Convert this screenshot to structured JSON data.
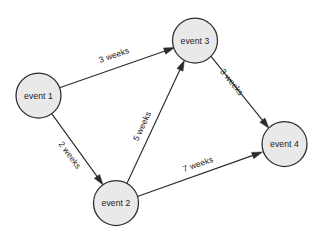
{
  "diagram": {
    "type": "directed-graph",
    "canvas": {
      "width": 324,
      "height": 243,
      "background": "#ffffff"
    },
    "style": {
      "node_fill": "#e9e9e9",
      "node_stroke": "#2b2b2b",
      "edge_stroke": "#2b2b2b",
      "text_color": "#1a1a1a"
    },
    "nodes": [
      {
        "id": "event1",
        "label": "event 1",
        "cx": 38.5,
        "cy": 95.5,
        "r": 22.5
      },
      {
        "id": "event2",
        "label": "event 2",
        "cx": 116.0,
        "cy": 203.0,
        "r": 22.5
      },
      {
        "id": "event3",
        "label": "event 3",
        "cx": 195.0,
        "cy": 40.5,
        "r": 22.5
      },
      {
        "id": "event4",
        "label": "event 4",
        "cx": 284.5,
        "cy": 144.0,
        "r": 22.5
      }
    ],
    "edges": [
      {
        "id": "e1-e3",
        "from": "event1",
        "to": "event3",
        "label": "3 weeks",
        "x1": 59.6,
        "y1": 87.7,
        "x2": 174.5,
        "y2": 47.6,
        "label_x": 114,
        "label_y": 55,
        "label_rotate": -19
      },
      {
        "id": "e1-e2",
        "from": "event1",
        "to": "event2",
        "label": "2 weeks",
        "x1": 51.7,
        "y1": 113.7,
        "x2": 103.1,
        "y2": 184.9,
        "label_x": 70,
        "label_y": 155,
        "label_rotate": 54
      },
      {
        "id": "e2-e3",
        "from": "event2",
        "to": "event3",
        "label": "5 weeks",
        "x1": 127.0,
        "y1": 183.3,
        "x2": 184.4,
        "y2": 60.3,
        "label_x": 142,
        "label_y": 126,
        "label_rotate": -65
      },
      {
        "id": "e3-e4",
        "from": "event3",
        "to": "event4",
        "label": "3 weeks",
        "x1": 211.0,
        "y1": 56.3,
        "x2": 269.0,
        "y2": 128.3,
        "label_x": 232,
        "label_y": 82,
        "label_rotate": 51
      },
      {
        "id": "e2-e4",
        "from": "event2",
        "to": "event4",
        "label": "7 weeks",
        "x1": 138.1,
        "y1": 196.3,
        "x2": 262.5,
        "y2": 152.0,
        "label_x": 198,
        "label_y": 164,
        "label_rotate": -19
      }
    ]
  }
}
